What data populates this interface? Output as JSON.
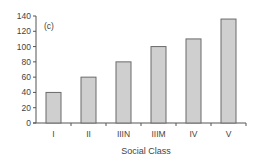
{
  "chart_data": {
    "type": "bar",
    "title": "",
    "panel_label": "(c)",
    "categories": [
      "I",
      "II",
      "IIIN",
      "IIIM",
      "IV",
      "V"
    ],
    "values": [
      40,
      60,
      80,
      100,
      110,
      136
    ],
    "xlabel": "Social Class",
    "ylabel": "",
    "ylim": [
      0,
      140
    ],
    "yticks": [
      0,
      20,
      40,
      60,
      80,
      100,
      120,
      140
    ],
    "grid": false,
    "legend": null,
    "bar_color": "#cfcfcf",
    "bar_edge_color": "#6a6a6a"
  }
}
